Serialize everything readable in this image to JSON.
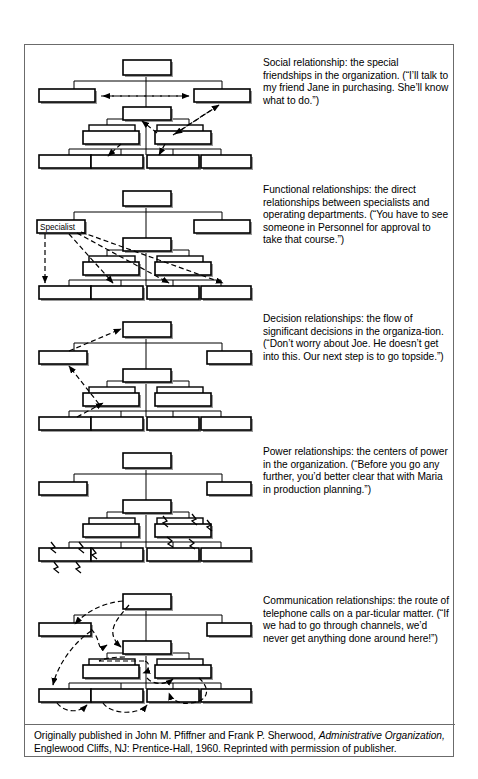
{
  "figure": {
    "frame_border_color": "#6b6b6b",
    "box_fill": "#ffffff",
    "box_stroke": "#000000",
    "line_color": "#000000",
    "shadow_color": "#9a9a9a"
  },
  "panels": [
    {
      "id": "social",
      "chart_name": "org-chart-social",
      "label_in_box": "",
      "text": "Social relationship: the special friendships in the organization. (“I’ll talk to my friend Jane in purchasing. She’ll know what to do.”)"
    },
    {
      "id": "functional",
      "chart_name": "org-chart-functional",
      "label_in_box": "Specialist",
      "text": "Functional relationships: the direct relationships between specialists and operating departments. (“You have to see someone in Personnel for approval to take that course.”)"
    },
    {
      "id": "decision",
      "chart_name": "org-chart-decision",
      "label_in_box": "",
      "text": "Decision relationships: the flow of significant decisions in the organiza-tion. (“Don’t worry about Joe. He doesn’t get into this. Our next step is to go topside.”)"
    },
    {
      "id": "power",
      "chart_name": "org-chart-power",
      "label_in_box": "",
      "text": "Power relationships: the centers of power in the organization. (“Before you go any further, you’d better clear that with Maria in production planning.”)"
    },
    {
      "id": "communication",
      "chart_name": "org-chart-communication",
      "label_in_box": "",
      "text": "Communication relationships: the route of telephone calls on a par-ticular matter. (“If we had to go through channels, we’d never get anything done around here!”)"
    }
  ],
  "caption": {
    "part1": "Originally published in John M. Pfiffner and Frank P. Sherwood, ",
    "italic": "Administrative Organization,",
    "part2": " Englewood Cliffs, NJ: Prentice-Hall, 1960. Reprinted with permission of publisher."
  }
}
